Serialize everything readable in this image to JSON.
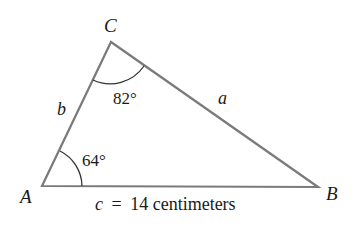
{
  "diagram": {
    "type": "triangle",
    "vertices": {
      "A": {
        "label": "A",
        "x": 42,
        "y": 186
      },
      "B": {
        "label": "B",
        "x": 318,
        "y": 187
      },
      "C": {
        "label": "C",
        "x": 111,
        "y": 42
      }
    },
    "sides": {
      "a": {
        "label": "a"
      },
      "b": {
        "label": "b"
      },
      "c": {
        "label": "c",
        "equals": "=",
        "value": "14 centimeters"
      }
    },
    "angles": {
      "A": {
        "value": "64°"
      },
      "C": {
        "value": "82°"
      }
    },
    "colors": {
      "stroke": "#7a7a7a",
      "arc": "#333333",
      "text": "#1a1a1a"
    }
  }
}
